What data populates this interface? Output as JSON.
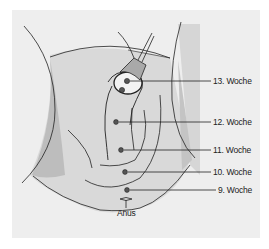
{
  "diagram": {
    "labels": [
      {
        "id": "w13",
        "text": "13. Woche",
        "x": 213,
        "y": 76,
        "dotX": 127,
        "dotY": 81
      },
      {
        "id": "w12",
        "text": "12. Woche",
        "x": 213,
        "y": 118,
        "dotX": 116,
        "dotY": 122
      },
      {
        "id": "w11",
        "text": "11. Woche",
        "x": 213,
        "y": 146,
        "dotX": 121,
        "dotY": 150
      },
      {
        "id": "w10",
        "text": "10. Woche",
        "x": 213,
        "y": 168,
        "dotX": 125,
        "dotY": 172
      },
      {
        "id": "w9",
        "text": "9. Woche",
        "x": 218,
        "y": 186,
        "dotX": 127,
        "dotY": 190
      }
    ],
    "anus_label": "Anus",
    "colors": {
      "background": "#eeeeee",
      "skin_light": "#d9d9d9",
      "skin_dark": "#bfbfbf",
      "line": "#222222",
      "dot": "#555555"
    }
  }
}
